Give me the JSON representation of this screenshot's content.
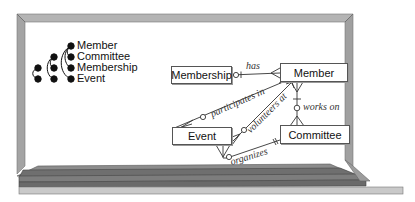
{
  "scene": {
    "type": "whiteboard-illustration",
    "colors": {
      "frame": "#a9a9a9",
      "frame_dark": "#7a7a7a",
      "tray_dark": "#6e6e6e",
      "tray_mid": "#8a8a8a",
      "tray_light": "#c8c8c8",
      "board": "#ffffff",
      "ink": "#111111"
    }
  },
  "legend": {
    "items": [
      {
        "label": "Member"
      },
      {
        "label": "Committee"
      },
      {
        "label": "Membership"
      },
      {
        "label": "Event"
      }
    ]
  },
  "diagram": {
    "entities": [
      {
        "id": "membership",
        "label": "Membership"
      },
      {
        "id": "member",
        "label": "Member"
      },
      {
        "id": "event",
        "label": "Event"
      },
      {
        "id": "committee",
        "label": "Committee"
      }
    ],
    "relationships": [
      {
        "label": "has",
        "from": "Membership",
        "to": "Member"
      },
      {
        "label": "participates in",
        "from": "Event",
        "to": "Member"
      },
      {
        "label": "volunteers at",
        "from": "Event",
        "to": "Member"
      },
      {
        "label": "works on",
        "from": "Member",
        "to": "Committee"
      },
      {
        "label": "organizes",
        "from": "Event",
        "to": "Committee"
      }
    ]
  }
}
